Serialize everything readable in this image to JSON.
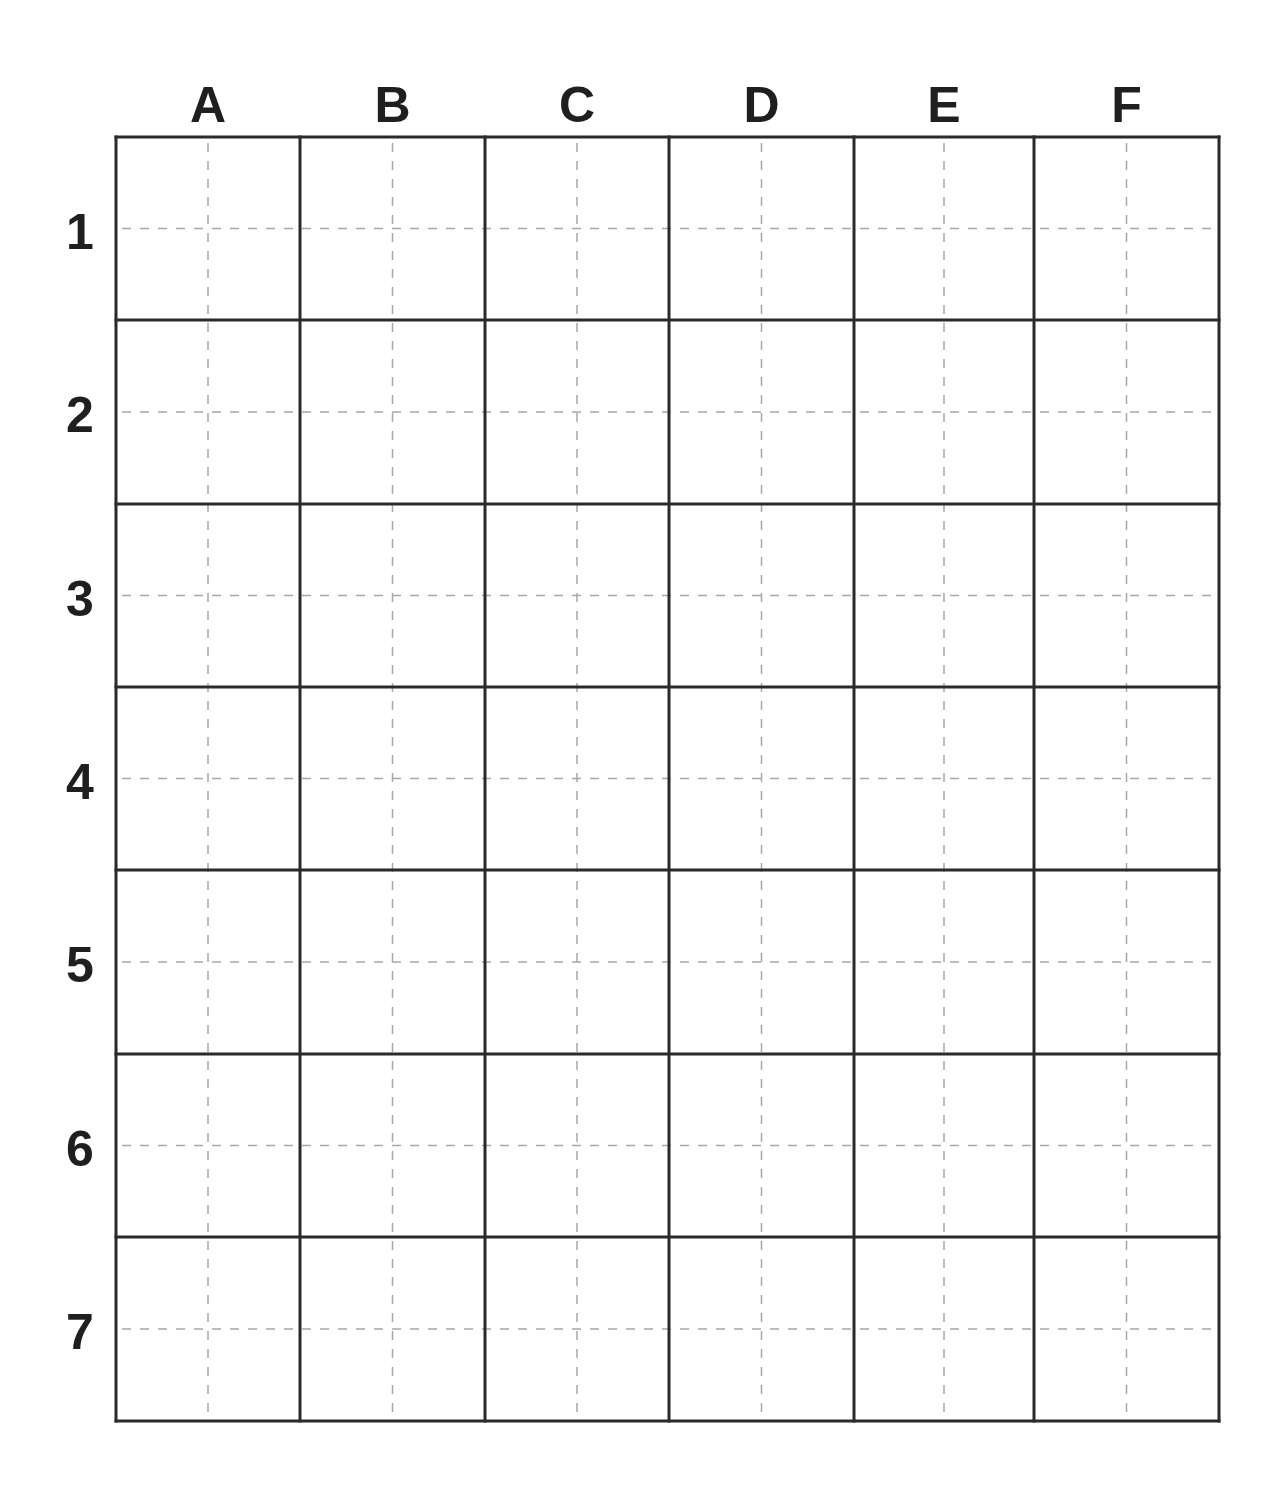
{
  "board": {
    "columns": [
      "A",
      "B",
      "C",
      "D",
      "E",
      "F"
    ],
    "rows": [
      "1",
      "2",
      "3",
      "4",
      "5",
      "6",
      "7"
    ],
    "col_lines_x": [
      116,
      300,
      485,
      669,
      854,
      1034,
      1219
    ],
    "row_lines_y": [
      137,
      320,
      504,
      687,
      870,
      1054,
      1237,
      1421
    ],
    "col_label_y": 105,
    "row_label_x": 80,
    "colors": {
      "grid_line": "#2a2a2a",
      "guide_line": "#a8a8a8",
      "label": "#1f1f1f",
      "background": "#ffffff"
    }
  }
}
